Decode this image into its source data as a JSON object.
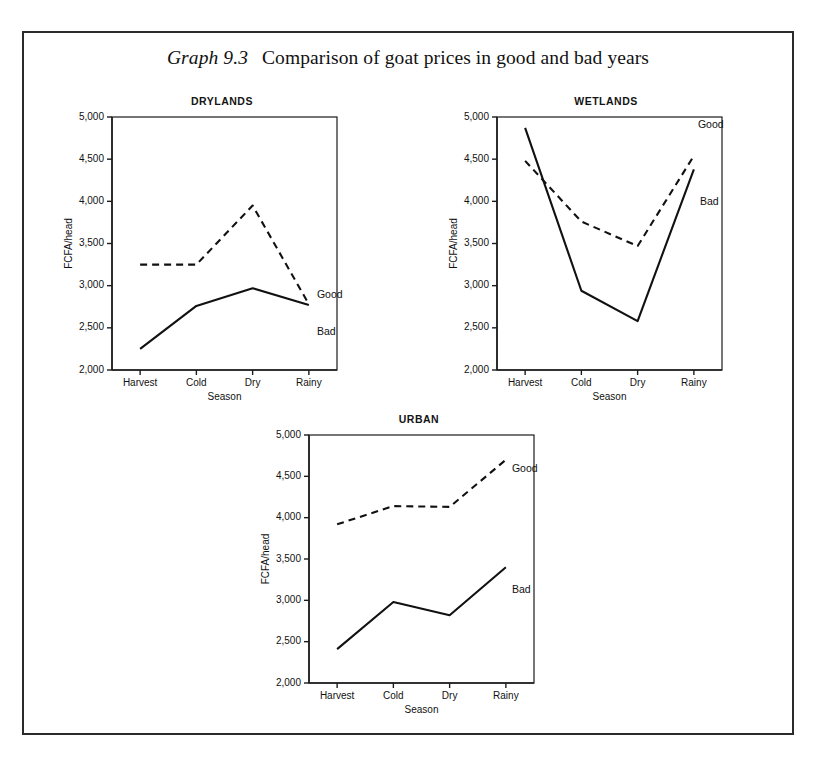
{
  "figure": {
    "caption_number": "Graph 9.3",
    "caption_text": "Comparison of goat prices in good and bad years"
  },
  "chart_data": [
    {
      "type": "line",
      "title": "DRYLANDS",
      "xlabel": "Season",
      "ylabel": "FCFA/head",
      "categories": [
        "Harvest",
        "Cold",
        "Dry",
        "Rainy"
      ],
      "ylim": [
        2000,
        5000
      ],
      "yticks": [
        2000,
        2500,
        3000,
        3500,
        4000,
        4500,
        5000
      ],
      "ytick_labels": [
        "2,000",
        "2,500",
        "3,000",
        "3,500",
        "4,000",
        "4,500",
        "5,000"
      ],
      "grid": false,
      "legend_position": "inline-right",
      "series": [
        {
          "name": "Good",
          "style": "dashed",
          "values": [
            3250,
            3250,
            3950,
            2780
          ]
        },
        {
          "name": "Bad",
          "style": "solid",
          "values": [
            2250,
            2760,
            2970,
            2770
          ]
        }
      ]
    },
    {
      "type": "line",
      "title": "WETLANDS",
      "xlabel": "Season",
      "ylabel": "FCFA/head",
      "categories": [
        "Harvest",
        "Cold",
        "Dry",
        "Rainy"
      ],
      "ylim": [
        2000,
        5000
      ],
      "yticks": [
        2000,
        2500,
        3000,
        3500,
        4000,
        4500,
        5000
      ],
      "ytick_labels": [
        "2,000",
        "2,500",
        "3,000",
        "3,500",
        "4,000",
        "4,500",
        "5,000"
      ],
      "grid": false,
      "legend_position": "inline-right",
      "series": [
        {
          "name": "Good",
          "style": "dashed",
          "values": [
            4480,
            3760,
            3470,
            4540
          ]
        },
        {
          "name": "Bad",
          "style": "solid",
          "values": [
            4870,
            2940,
            2580,
            4380
          ]
        }
      ]
    },
    {
      "type": "line",
      "title": "URBAN",
      "xlabel": "Season",
      "ylabel": "FCFA/head",
      "categories": [
        "Harvest",
        "Cold",
        "Dry",
        "Rainy"
      ],
      "ylim": [
        2000,
        5000
      ],
      "yticks": [
        2000,
        2500,
        3000,
        3500,
        4000,
        4500,
        5000
      ],
      "ytick_labels": [
        "2,000",
        "2,500",
        "3,000",
        "3,500",
        "4,000",
        "4,500",
        "5,000"
      ],
      "grid": false,
      "legend_position": "inline-right",
      "series": [
        {
          "name": "Good",
          "style": "dashed",
          "values": [
            3920,
            4140,
            4130,
            4700
          ]
        },
        {
          "name": "Bad",
          "style": "solid",
          "values": [
            2410,
            2980,
            2820,
            3400
          ]
        }
      ]
    }
  ],
  "panels": [
    {
      "key": "drylands",
      "title": "DRYLANDS"
    },
    {
      "key": "wetlands",
      "title": "WETLANDS"
    },
    {
      "key": "urban",
      "title": "URBAN"
    }
  ]
}
